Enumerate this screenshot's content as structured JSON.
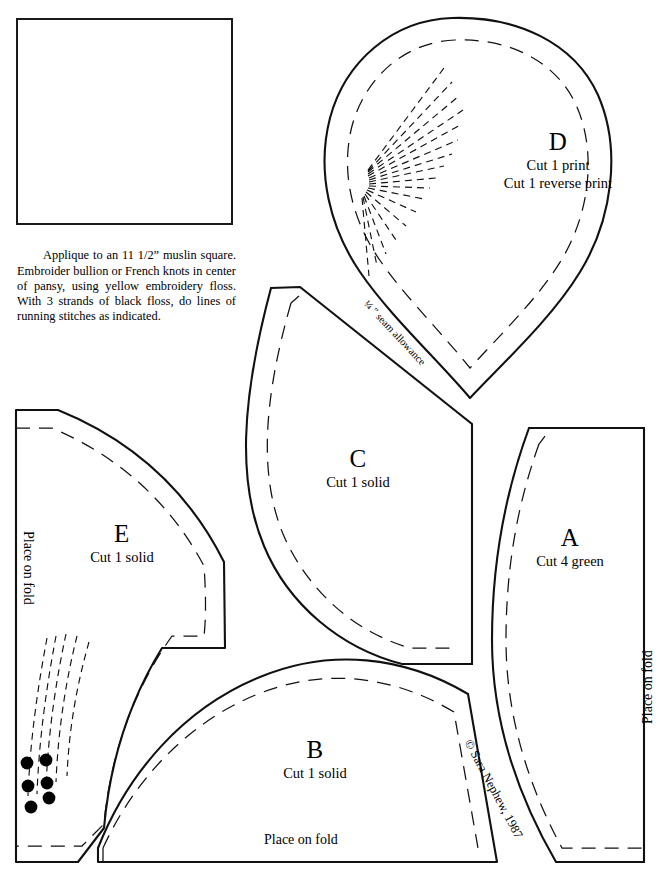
{
  "sheet": {
    "title": "Pansy Applique Pattern Sheet",
    "copyright": "© Sara Nephew, 1987",
    "seam_allowance_label": "¼ ” seam allowance",
    "place_on_fold_label": "Place on fold"
  },
  "instructions": {
    "text": "Applique to an 11 1/2” muslin square. Embroider bullion or French knots in center of pansy, using yellow embroidery floss. With 3 strands of black floss, do lines of running stitches as indicated."
  },
  "diagram": {
    "name": "pansy-assembly-diagram",
    "petal_labels": [
      "A",
      "B",
      "C",
      "D",
      "D",
      "E"
    ],
    "fills": {
      "leaf_stipple": "#9a9a9a",
      "leaf_crosshatch": "#a8a8a8",
      "petal_b": "#dcdcdc",
      "petal_c": "#f2f2f2",
      "petal_d": "#ececec",
      "petal_e": "#f7f7f7",
      "outline": "#1a1a1a"
    }
  },
  "pieces": [
    {
      "id": "piece-d",
      "letter": "D",
      "cut_lines": [
        "Cut 1 print",
        "Cut 1 reverse print"
      ],
      "place_on_fold": false,
      "seam_allowance": true,
      "stitch_fan": true
    },
    {
      "id": "piece-c",
      "letter": "C",
      "cut_lines": [
        "Cut 1 solid"
      ],
      "place_on_fold": false,
      "seam_allowance": false,
      "stitch_fan": false
    },
    {
      "id": "piece-a",
      "letter": "A",
      "cut_lines": [
        "Cut 4 green"
      ],
      "place_on_fold": true,
      "seam_allowance": false,
      "stitch_fan": false
    },
    {
      "id": "piece-e",
      "letter": "E",
      "cut_lines": [
        "Cut 1 solid"
      ],
      "place_on_fold": true,
      "seam_allowance": false,
      "stitch_fan": true,
      "french_knots": 6
    },
    {
      "id": "piece-b",
      "letter": "B",
      "cut_lines": [
        "Cut 1 solid"
      ],
      "place_on_fold": true,
      "seam_allowance": false,
      "stitch_fan": false
    }
  ],
  "colors": {
    "ink": "#000000",
    "line": "#111111",
    "paper": "#ffffff"
  }
}
